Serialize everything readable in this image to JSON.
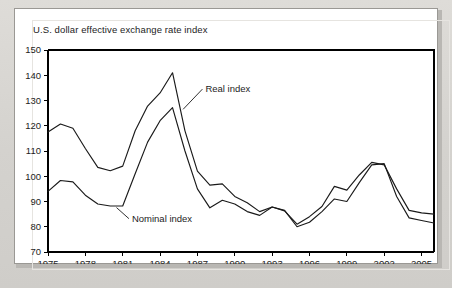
{
  "figure": {
    "title": "U.S. dollar effective exchange rate index"
  },
  "annotations": {
    "real": "Real index",
    "nominal": "Nominal index"
  },
  "colors": {
    "line": "#1a1a1a",
    "panel_background": "#ffffff",
    "page_background": "#d6d4d0",
    "axis": "#000000"
  },
  "chart_data": {
    "type": "line",
    "title": "U.S. dollar effective exchange rate index",
    "xlabel": "",
    "ylabel": "",
    "xlim": [
      1975,
      2006
    ],
    "ylim": [
      70,
      150
    ],
    "yticks": [
      70,
      80,
      90,
      100,
      110,
      120,
      130,
      140,
      150
    ],
    "xticks": [
      1975,
      1978,
      1981,
      1984,
      1987,
      1990,
      1993,
      1996,
      1999,
      2002,
      2005
    ],
    "xtick_labels": [
      "1975",
      "1978",
      "1981",
      "1984",
      "1987",
      "1990",
      "1993",
      "1996",
      "1999",
      "2002",
      "2005"
    ],
    "ytick_labels": [
      "70",
      "80",
      "90",
      "100",
      "110",
      "120",
      "130",
      "140",
      "150"
    ],
    "grid": false,
    "legend": "annotated-inline",
    "x": [
      1975,
      1976,
      1977,
      1978,
      1979,
      1980,
      1981,
      1982,
      1983,
      1984,
      1985,
      1986,
      1987,
      1988,
      1989,
      1990,
      1991,
      1992,
      1993,
      1994,
      1995,
      1996,
      1997,
      1998,
      1999,
      2000,
      2001,
      2002,
      2003,
      2004,
      2005,
      2006
    ],
    "series": [
      {
        "name": "Real index",
        "values": [
          117.5,
          120.7,
          119.0,
          111.0,
          103.5,
          102.2,
          104.0,
          118.0,
          127.8,
          133.0,
          141.0,
          118.0,
          102.0,
          96.5,
          97.0,
          92.0,
          89.5,
          86.0,
          86.0,
          83.5,
          84.0,
          87.8,
          86.3,
          81.0,
          84.0,
          88.0,
          96.0,
          94.5,
          94.5,
          100.5,
          105.5,
          104.5
        ]
      },
      {
        "name": "Nominal index",
        "values": [
          94.0,
          98.3,
          97.8,
          92.5,
          89.0,
          88.2,
          88.2,
          101.0,
          113.5,
          122.0,
          127.2,
          110.0,
          95.0,
          87.5,
          88.0,
          90.5,
          87.5,
          89.5,
          86.0,
          85.5,
          84.0,
          83.3,
          87.8,
          86.5,
          86.0,
          81.5,
          80.0,
          82.0,
          85.5,
          88.0,
          90.5,
          90.0
        ]
      }
    ],
    "real_index_points": [
      [
        1975,
        117.5
      ],
      [
        1976,
        120.7
      ],
      [
        1977,
        119.0
      ],
      [
        1978,
        111.0
      ],
      [
        1979,
        103.5
      ],
      [
        1980,
        102.2
      ],
      [
        1981,
        104.0
      ],
      [
        1982,
        118.0
      ],
      [
        1983,
        127.8
      ],
      [
        1984,
        133.0
      ],
      [
        1985,
        141.0
      ],
      [
        1986,
        118.0
      ],
      [
        1987,
        102.0
      ],
      [
        1988,
        96.5
      ],
      [
        1989,
        97.0
      ],
      [
        1990,
        92.0
      ],
      [
        1991,
        89.5
      ],
      [
        1992,
        86.0
      ],
      [
        1993,
        87.8
      ],
      [
        1994,
        86.3
      ],
      [
        1995,
        81.0
      ],
      [
        1996,
        84.0
      ],
      [
        1997,
        88.0
      ],
      [
        1998,
        96.0
      ],
      [
        1999,
        94.5
      ],
      [
        2000,
        100.5
      ],
      [
        2001,
        105.5
      ],
      [
        2002,
        104.5
      ],
      [
        2003,
        95.0
      ],
      [
        2004,
        86.5
      ],
      [
        2005,
        85.5
      ],
      [
        2006,
        85.0
      ]
    ],
    "nominal_index_points": [
      [
        1975,
        94.0
      ],
      [
        1976,
        98.3
      ],
      [
        1977,
        97.8
      ],
      [
        1978,
        92.5
      ],
      [
        1979,
        89.0
      ],
      [
        1980,
        88.2
      ],
      [
        1981,
        88.2
      ],
      [
        1982,
        101.0
      ],
      [
        1983,
        113.5
      ],
      [
        1984,
        122.0
      ],
      [
        1985,
        127.2
      ],
      [
        1986,
        110.0
      ],
      [
        1987,
        95.0
      ],
      [
        1988,
        87.5
      ],
      [
        1989,
        90.5
      ],
      [
        1990,
        89.0
      ],
      [
        1991,
        86.0
      ],
      [
        1992,
        84.5
      ],
      [
        1993,
        87.8
      ],
      [
        1994,
        86.5
      ],
      [
        1995,
        80.0
      ],
      [
        1996,
        81.8
      ],
      [
        1997,
        86.0
      ],
      [
        1998,
        91.0
      ],
      [
        1999,
        90.0
      ],
      [
        2000,
        97.5
      ],
      [
        2001,
        104.5
      ],
      [
        2002,
        105.0
      ],
      [
        2003,
        92.0
      ],
      [
        2004,
        83.5
      ],
      [
        2005,
        82.5
      ],
      [
        2006,
        81.5
      ]
    ],
    "annotations": [
      {
        "text": "Real index",
        "points_to_year": 1986,
        "points_to_value": 132.0
      },
      {
        "text": "Nominal index",
        "points_to_year": 1981,
        "points_to_value": 88.2
      }
    ],
    "peak_real": {
      "year": 1985,
      "value": 141.0
    },
    "peak_nominal": {
      "year": 1985,
      "value": 127.2
    }
  }
}
